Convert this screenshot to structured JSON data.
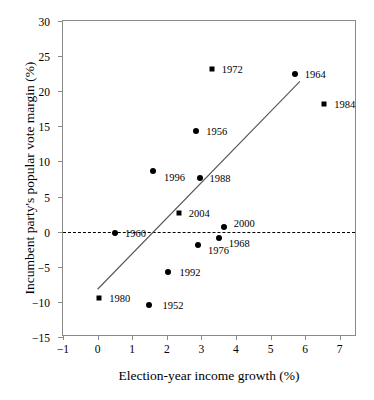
{
  "chart_data": {
    "type": "scatter",
    "title": "",
    "xlabel": "Election-year income growth (%)",
    "ylabel": "Incumbent party's popular vote margin (%)",
    "xlim": [
      -1,
      7.5
    ],
    "ylim": [
      -15,
      30
    ],
    "xticks": [
      "-1",
      "0",
      "1",
      "2",
      "3",
      "4",
      "5",
      "6",
      "7"
    ],
    "xtick_values": [
      -1,
      0,
      1,
      2,
      3,
      4,
      5,
      6,
      7
    ],
    "yticks": [
      "30",
      "25",
      "20",
      "15",
      "10",
      "5",
      "0",
      "-5",
      "-10",
      "-15"
    ],
    "ytick_values": [
      30,
      25,
      20,
      15,
      10,
      5,
      0,
      -5,
      -10,
      -15
    ],
    "grid": false,
    "legend": "none",
    "marker_color": "#000000",
    "line_color": "#555555",
    "zero_line": {
      "y": 0,
      "style": "dashed",
      "color": "#000000"
    },
    "trend_line": {
      "x_start": 0.0,
      "y_start": -8.2,
      "x_end": 5.85,
      "y_end": 21.4
    },
    "points": [
      {
        "label": "1952",
        "x": 1.5,
        "y": -10.4,
        "marker": "circle",
        "label_dx": 13,
        "label_dy": 0
      },
      {
        "label": "1956",
        "x": 2.85,
        "y": 14.3,
        "marker": "circle",
        "label_dx": 10,
        "label_dy": 0
      },
      {
        "label": "1960",
        "x": 0.5,
        "y": -0.2,
        "marker": "circle",
        "label_dx": 10,
        "label_dy": 0
      },
      {
        "label": "1964",
        "x": 5.7,
        "y": 22.5,
        "marker": "circle",
        "label_dx": 10,
        "label_dy": 0
      },
      {
        "label": "1968",
        "x": 3.5,
        "y": -0.9,
        "marker": "circle",
        "label_dx": 10,
        "label_dy": 5
      },
      {
        "label": "1972",
        "x": 3.3,
        "y": 23.1,
        "marker": "square",
        "label_dx": 10,
        "label_dy": 0
      },
      {
        "label": "1976",
        "x": 2.9,
        "y": -1.9,
        "marker": "circle",
        "label_dx": 10,
        "label_dy": 5
      },
      {
        "label": "1980",
        "x": 0.05,
        "y": -9.4,
        "marker": "square",
        "label_dx": 10,
        "label_dy": 0
      },
      {
        "label": "1984",
        "x": 6.55,
        "y": 18.2,
        "marker": "square",
        "label_dx": 10,
        "label_dy": 0
      },
      {
        "label": "1988",
        "x": 2.95,
        "y": 7.6,
        "marker": "circle",
        "label_dx": 10,
        "label_dy": 0
      },
      {
        "label": "1992",
        "x": 2.05,
        "y": -5.7,
        "marker": "circle",
        "label_dx": 11,
        "label_dy": 0
      },
      {
        "label": "1996",
        "x": 1.6,
        "y": 8.6,
        "marker": "circle",
        "label_dx": 11,
        "label_dy": 6
      },
      {
        "label": "2000",
        "x": 3.65,
        "y": 0.6,
        "marker": "circle",
        "label_dx": 10,
        "label_dy": -4
      },
      {
        "label": "2004",
        "x": 2.35,
        "y": 2.6,
        "marker": "square",
        "label_dx": 10,
        "label_dy": 0
      }
    ]
  }
}
